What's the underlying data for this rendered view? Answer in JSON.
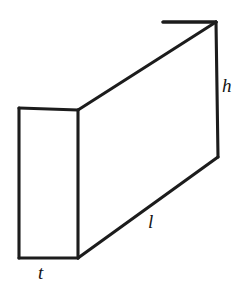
{
  "figure": {
    "kind": "rectangular-box-diagram",
    "background_color": "#ffffff",
    "line_color": "#1c1c1c",
    "line_width": 3.1,
    "labels": {
      "height": "h",
      "length": "l",
      "thickness": "t"
    },
    "label_positions": {
      "height": "right edge, vertical dimension",
      "length": "bottom front-right diagonal, depth dimension",
      "thickness": "bottom front edge, width dimension"
    }
  },
  "geometry": {
    "front_top_left": "19,108",
    "front_top_right": "78,110",
    "front_bottom_right": "78,258",
    "front_bottom_left": "19,258",
    "back_top_left": "163,22",
    "back_top_right": "216,22",
    "back_bottom_right": "218,157",
    "front_face_points": "19,108 78,110 78,258 19,258",
    "top_face_points": "19,108 163,22 216,22 78,110",
    "side_face_points": "78,110 216,22 218,157 78,258"
  },
  "chart_data": {
    "type": "diagram",
    "title": "",
    "shape": "cuboid",
    "projection": "oblique",
    "dimension_labels": [
      "h",
      "l",
      "t"
    ],
    "visible_faces": [
      "front",
      "top",
      "right-side"
    ],
    "edges": [
      {
        "name": "front-top",
        "from": "19,108",
        "to": "78,110"
      },
      {
        "name": "front-right-vertical",
        "from": "78,110",
        "to": "78,258"
      },
      {
        "name": "front-bottom",
        "from": "78,258",
        "to": "19,258"
      },
      {
        "name": "front-left-vertical",
        "from": "19,258",
        "to": "19,108"
      },
      {
        "name": "top-back-left-diagonal",
        "from": "19,108",
        "to": "163,22"
      },
      {
        "name": "top-back",
        "from": "163,22",
        "to": "216,22"
      },
      {
        "name": "top-right-diagonal",
        "from": "216,22",
        "to": "78,110"
      },
      {
        "name": "right-vertical",
        "from": "216,22",
        "to": "218,157"
      },
      {
        "name": "bottom-right-diagonal",
        "from": "218,157",
        "to": "78,258"
      }
    ]
  }
}
